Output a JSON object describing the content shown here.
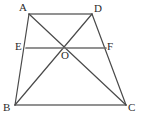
{
  "figure": {
    "kind": "geometry-diagram",
    "canvas": {
      "width": 143,
      "height": 121
    },
    "colors": {
      "background": "#ffffff",
      "stroke": "#4a4a4a",
      "stroke_strong": "#6e6e6e",
      "label": "#2b2b2b"
    },
    "stroke_width": 1.2,
    "points": [
      {
        "id": "A",
        "label": "A",
        "x": 29,
        "y": 14,
        "label_x": 19,
        "label_y": 2
      },
      {
        "id": "D",
        "label": "D",
        "x": 92,
        "y": 14,
        "label_x": 94,
        "label_y": 3
      },
      {
        "id": "B",
        "label": "B",
        "x": 15,
        "y": 105,
        "label_x": 3,
        "label_y": 102
      },
      {
        "id": "C",
        "label": "C",
        "x": 126,
        "y": 105,
        "label_x": 128,
        "label_y": 102
      },
      {
        "id": "E",
        "label": "E",
        "x": 26,
        "y": 48,
        "label_x": 15,
        "label_y": 41
      },
      {
        "id": "F",
        "label": "F",
        "x": 106,
        "y": 48,
        "label_x": 107,
        "label_y": 41
      },
      {
        "id": "O",
        "label": "O",
        "x": 65,
        "y": 48,
        "label_x": 61,
        "label_y": 50
      }
    ],
    "segments": [
      {
        "id": "AD",
        "name": "segment-ad",
        "from": "A",
        "to": "D",
        "weight": "strong"
      },
      {
        "id": "BC",
        "name": "segment-bc",
        "from": "B",
        "to": "C",
        "weight": "strong"
      },
      {
        "id": "AB",
        "name": "segment-ab",
        "from": "A",
        "to": "B",
        "weight": "normal"
      },
      {
        "id": "DC",
        "name": "segment-dc",
        "from": "D",
        "to": "C",
        "weight": "normal"
      },
      {
        "id": "AC",
        "name": "diagonal-ac",
        "from": "A",
        "to": "C",
        "weight": "normal"
      },
      {
        "id": "DB",
        "name": "diagonal-db",
        "from": "D",
        "to": "B",
        "weight": "normal"
      },
      {
        "id": "EF",
        "name": "segment-ef",
        "from": "E",
        "to": "F",
        "weight": "strong"
      }
    ]
  }
}
